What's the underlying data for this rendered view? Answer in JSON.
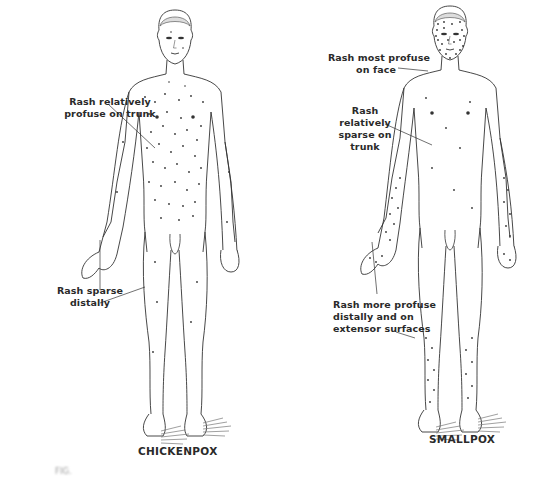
{
  "figure": {
    "left_panel": {
      "title": "CHICKENPOX",
      "annotations": [
        {
          "line1": "Rash relatively",
          "line2": "profuse on trunk"
        },
        {
          "line1": "Rash sparse",
          "line2": "distally"
        }
      ]
    },
    "right_panel": {
      "title": "SMALLPOX",
      "annotations": [
        {
          "line1": "Rash most profuse",
          "line2": "on face"
        },
        {
          "line1": "Rash relatively",
          "line2": "sparse on trunk"
        },
        {
          "line1": "Rash more profuse",
          "line2": "distally and on",
          "line3": "extensor surfaces"
        }
      ]
    },
    "caption": "FIG."
  },
  "colors": {
    "ink": "#2a2a2a",
    "background": "#ffffff"
  }
}
